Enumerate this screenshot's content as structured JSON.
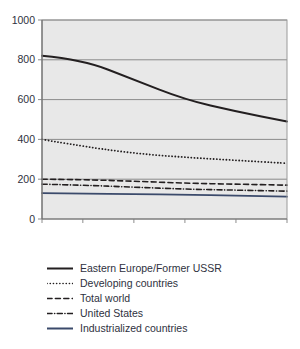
{
  "chart_data": {
    "type": "line",
    "title": "",
    "xlabel": "",
    "ylabel": "",
    "xlim": [
      2001,
      2025
    ],
    "ylim": [
      0,
      1000
    ],
    "grid": true,
    "legend_position": "below",
    "xticks": [
      2001,
      2005,
      2010,
      2015,
      2020,
      2025
    ],
    "xtick_labels": [
      "2001",
      "2005",
      "2010",
      "2015",
      "2020",
      "2025"
    ],
    "yticks": [
      0,
      200,
      400,
      600,
      800,
      1000
    ],
    "ytick_labels": [
      "0",
      "200",
      "400",
      "600",
      "800",
      "1000"
    ],
    "x": [
      2001,
      2005,
      2010,
      2015,
      2020,
      2025
    ],
    "series": [
      {
        "name": "Eastern Europe/Former USSR",
        "style": "solid",
        "color": "#231f20",
        "width": 2.0,
        "values": [
          820,
          800,
          700,
          600,
          540,
          490
        ]
      },
      {
        "name": "Developing countries",
        "style": "dotted",
        "color": "#231f20",
        "width": 1.8,
        "values": [
          400,
          365,
          330,
          310,
          295,
          280
        ]
      },
      {
        "name": "Total world",
        "style": "dashed",
        "color": "#231f20",
        "width": 1.6,
        "values": [
          200,
          198,
          190,
          180,
          175,
          170
        ]
      },
      {
        "name": "United States",
        "style": "dashdot",
        "color": "#231f20",
        "width": 1.6,
        "values": [
          175,
          170,
          160,
          150,
          145,
          140
        ]
      },
      {
        "name": "Industrialized countries",
        "style": "solid",
        "color": "#3b4croy",
        "width": 1.8,
        "values": [
          130,
          128,
          125,
          122,
          118,
          112
        ]
      }
    ],
    "plot_bgcolor": "#e8e8e8",
    "grid_color": "#808080",
    "axis_color": "#808080",
    "industrialized_color": "#3b4a6b"
  },
  "legend": {
    "entries": [
      {
        "label": "Eastern Europe/Former USSR",
        "style": "solid",
        "color": "#231f20"
      },
      {
        "label": "Developing countries",
        "style": "dotted",
        "color": "#231f20"
      },
      {
        "label": "Total world",
        "style": "dashed",
        "color": "#231f20"
      },
      {
        "label": "United States",
        "style": "dashdot",
        "color": "#231f20"
      },
      {
        "label": "Industrialized countries",
        "style": "solid",
        "color": "#3b4a6b"
      }
    ]
  }
}
